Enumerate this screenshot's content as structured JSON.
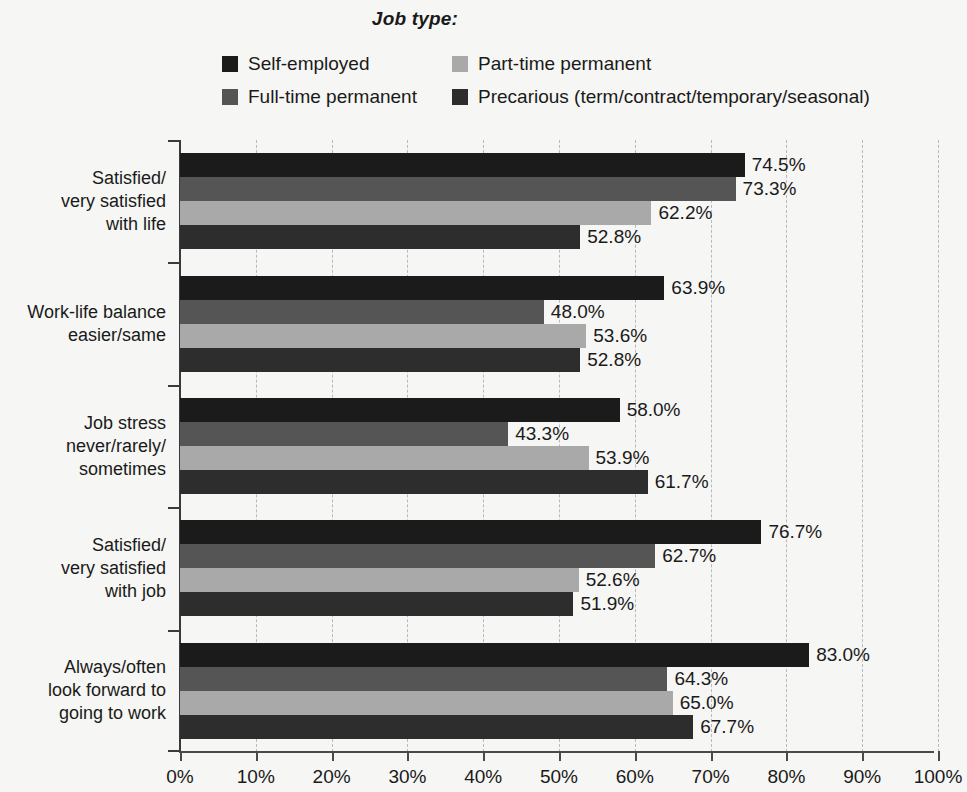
{
  "legend": {
    "title": "Job type:",
    "items": [
      {
        "label": "Self-employed",
        "color": "#1b1b1b",
        "key": "self_employed"
      },
      {
        "label": "Part-time permanent",
        "color": "#a9a9a9",
        "key": "part_time_permanent"
      },
      {
        "label": "Full-time permanent",
        "color": "#555555",
        "key": "full_time_permanent"
      },
      {
        "label": "Precarious (term/contract/temporary/seasonal)",
        "color": "#2d2d2d",
        "key": "precarious"
      }
    ]
  },
  "axis": {
    "x_tick_labels": [
      "0%",
      "10%",
      "20%",
      "30%",
      "40%",
      "50%",
      "60%",
      "70%",
      "80%",
      "90%",
      "100%"
    ],
    "x_min": 0,
    "x_max": 100
  },
  "chart_data": {
    "type": "bar",
    "orientation": "horizontal",
    "title": "Job type:",
    "xlabel": "",
    "ylabel": "",
    "xlim": [
      0,
      100
    ],
    "xticks": [
      0,
      10,
      20,
      30,
      40,
      50,
      60,
      70,
      80,
      90,
      100
    ],
    "xtick_labels": [
      "0%",
      "10%",
      "20%",
      "30%",
      "40%",
      "50%",
      "60%",
      "70%",
      "80%",
      "90%",
      "100%"
    ],
    "grid": true,
    "grid_axis": "x",
    "grid_style": "dashed",
    "legend_position": "top-center",
    "value_label_suffix": "%",
    "categories": [
      "Satisfied/\nvery satisfied\nwith life",
      "Work-life balance\neasier/same",
      "Job stress\nnever/rarely/\nsometimes",
      "Satisfied/\nvery satisfied\nwith job",
      "Always/often\nlook forward to\ngoing to work"
    ],
    "series": [
      {
        "name": "Self-employed",
        "color": "#1b1b1b",
        "values": [
          74.5,
          63.9,
          58.0,
          76.7,
          83.0
        ],
        "labels": [
          "74.5%",
          "63.9%",
          "58.0%",
          "76.7%",
          "83.0%"
        ]
      },
      {
        "name": "Full-time permanent",
        "color": "#555555",
        "values": [
          73.3,
          48.0,
          43.3,
          62.7,
          64.3
        ],
        "labels": [
          "73.3%",
          "48.0%",
          "43.3%",
          "62.7%",
          "64.3%"
        ]
      },
      {
        "name": "Part-time permanent",
        "color": "#a9a9a9",
        "values": [
          62.2,
          53.6,
          53.9,
          52.6,
          65.0
        ],
        "labels": [
          "62.2%",
          "53.6%",
          "53.9%",
          "52.6%",
          "65.0%"
        ]
      },
      {
        "name": "Precarious (term/contract/temporary/seasonal)",
        "color": "#2d2d2d",
        "values": [
          52.8,
          52.8,
          61.7,
          51.9,
          67.7
        ],
        "labels": [
          "52.8%",
          "52.8%",
          "61.7%",
          "51.9%",
          "67.7%"
        ]
      }
    ]
  }
}
